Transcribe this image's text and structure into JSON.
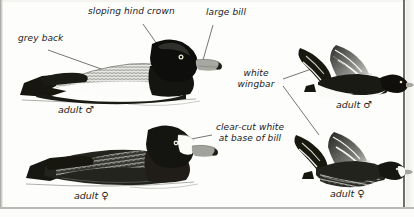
{
  "plate": {
    "title": "Greater Scaup identification plate",
    "background_color": "#fdfdfb",
    "ink_color": "#1c1c1a"
  },
  "annotations": [
    {
      "id": "grey-back",
      "text": "grey back",
      "x": 18,
      "y": 38,
      "leader": "to upper-left bird back"
    },
    {
      "id": "sloping-hind-crown",
      "text": "sloping hind crown",
      "x": 88,
      "y": 10,
      "leader": "to upper-left bird hind crown"
    },
    {
      "id": "large-bill",
      "text": "large bill",
      "x": 206,
      "y": 11,
      "leader": "to upper-left bird bill"
    },
    {
      "id": "white-wingbar",
      "text": "white wingbar",
      "x": 228,
      "y": 72,
      "leader": "to flying male and flying female wings"
    },
    {
      "id": "clear-cut-white",
      "text": "clear-cut white at base of bill",
      "x": 214,
      "y": 126,
      "leader": "to lower-left female face"
    }
  ],
  "figures": [
    {
      "id": "swimming-male",
      "caption": "adult",
      "symbol": "♂",
      "caption_x": 58,
      "caption_y": 107,
      "pose": "swimming",
      "sex": "male"
    },
    {
      "id": "flying-male",
      "caption": "adult",
      "symbol": "♂",
      "caption_x": 336,
      "caption_y": 101,
      "pose": "flying",
      "sex": "male"
    },
    {
      "id": "swimming-female",
      "caption": "adult",
      "symbol": "♀",
      "caption_x": 74,
      "caption_y": 192,
      "caption_y2": 192,
      "pose": "swimming",
      "sex": "female"
    },
    {
      "id": "flying-female",
      "caption": "adult",
      "symbol": "♀",
      "caption_x": 330,
      "caption_y": 190,
      "pose": "flying",
      "sex": "female"
    }
  ],
  "colors": {
    "ink": "#1c1c1a",
    "paper": "#fdfdfb",
    "grey_vermiculation": "#8d8d8a",
    "bill_grey": "#9d9d99",
    "eye_yellow": "#e8e3c8",
    "leader_line": "#3a3a38"
  }
}
